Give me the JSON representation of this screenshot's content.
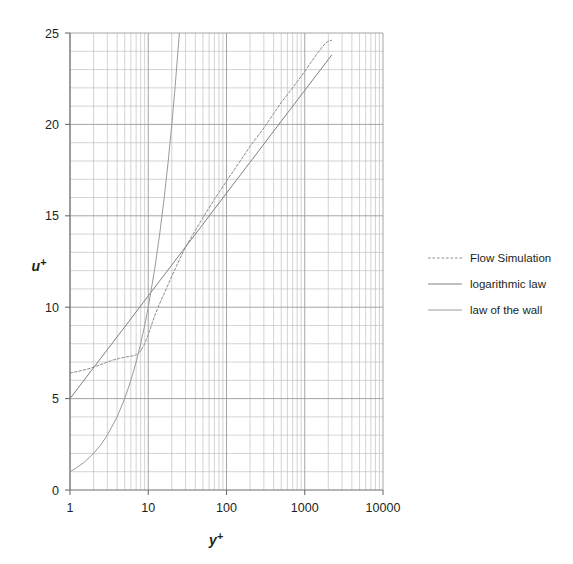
{
  "chart_data": {
    "type": "line",
    "title": "",
    "xlabel": "y+",
    "ylabel": "u+",
    "xlabel_display": "y",
    "ylabel_display": "u",
    "xscale": "log",
    "yscale": "linear",
    "xlim": [
      1,
      10000
    ],
    "ylim": [
      0,
      25
    ],
    "grid": true,
    "grid_minor": true,
    "legend_position": "right",
    "xticks": [
      1,
      10,
      100,
      1000,
      10000
    ],
    "xtick_labels": [
      "1",
      "10",
      "100",
      "1000",
      "10000"
    ],
    "yticks": [
      0,
      5,
      10,
      15,
      20,
      25
    ],
    "ytick_labels": [
      "0",
      "5",
      "10",
      "15",
      "20",
      "25"
    ],
    "ytick_minor_step": 1,
    "series": [
      {
        "name": "Flow Simulation",
        "style": "dashed",
        "color": "#8c8c8c",
        "x": [
          1,
          1.3,
          1.7,
          2.2,
          2.8,
          3.5,
          4.3,
          5.2,
          6.2,
          7.0,
          8.0,
          9.0,
          10,
          12,
          14,
          17,
          20,
          25,
          30,
          40,
          50,
          70,
          100,
          150,
          200,
          300,
          500,
          700,
          1000,
          1400,
          1800,
          2000,
          2200
        ],
        "y": [
          6.4,
          6.5,
          6.62,
          6.78,
          6.95,
          7.1,
          7.2,
          7.28,
          7.33,
          7.4,
          7.6,
          8.0,
          8.5,
          9.5,
          10.2,
          11.0,
          11.7,
          12.6,
          13.3,
          14.2,
          14.9,
          15.9,
          16.9,
          18.0,
          18.8,
          19.8,
          21.2,
          22.0,
          22.9,
          23.8,
          24.4,
          24.55,
          24.6
        ]
      },
      {
        "name": "logarithmic law",
        "style": "solid",
        "color": "#808080",
        "x": [
          1,
          2,
          5,
          10,
          20,
          50,
          100,
          200,
          500,
          1000,
          1500,
          2000,
          2200
        ],
        "y": [
          5.0,
          6.69,
          8.92,
          10.62,
          12.31,
          14.54,
          16.24,
          17.93,
          20.17,
          21.86,
          22.85,
          23.55,
          23.79
        ]
      },
      {
        "name": "law of the wall",
        "style": "solid",
        "color": "#9a9a9a",
        "x": [
          1,
          1.2,
          1.5,
          2,
          2.5,
          3,
          4,
          5,
          6,
          7,
          8,
          9,
          10,
          12,
          14,
          16,
          18,
          20,
          22,
          25
        ],
        "y": [
          1.0,
          1.2,
          1.5,
          2.0,
          2.5,
          3.0,
          4.0,
          5.0,
          6.0,
          7.0,
          8.0,
          9.0,
          10.0,
          12.0,
          14.0,
          16.0,
          18.0,
          20.0,
          22.0,
          25.0
        ]
      }
    ],
    "annotations": []
  },
  "legend": {
    "items": [
      {
        "label": "Flow Simulation",
        "style": "dashed",
        "color": "#8c8c8c"
      },
      {
        "label": "logarithmic law",
        "style": "solid",
        "color": "#808080"
      },
      {
        "label": "law of the wall",
        "style": "solid",
        "color": "#9a9a9a"
      }
    ]
  },
  "colors": {
    "background": "#ffffff",
    "axis": "#6f6f6f",
    "grid_major": "#9b9b9b",
    "grid_minor": "#c2c2c2",
    "text": "#231f20"
  }
}
